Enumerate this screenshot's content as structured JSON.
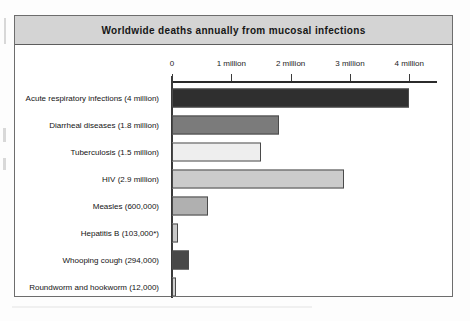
{
  "chart_data": {
    "type": "bar",
    "orientation": "horizontal",
    "title": "Worldwide deaths annually from mucosal infections",
    "xlabel": "",
    "ylabel": "",
    "xlim": [
      0,
      4350000
    ],
    "grid": false,
    "legend": null,
    "tick_labels": [
      "0",
      "1 million",
      "2 million",
      "3 million",
      "4 million"
    ],
    "tick_values": [
      0,
      1000000,
      2000000,
      3000000,
      4000000
    ],
    "categories": [
      "Acute respiratory infections (4 million)",
      "Diarrheal diseases (1.8 million)",
      "Tuberculosis (1.5 million)",
      "HIV (2.9 million)",
      "Measles (600,000)",
      "Hepatitis B (103,000*)",
      "Whooping cough (294,000)",
      "Roundworm and hookworm (12,000)"
    ],
    "values": [
      4000000,
      1800000,
      1500000,
      2900000,
      600000,
      103000,
      294000,
      12000
    ],
    "bar_colors": [
      "#2f2f2f",
      "#7b7b7b",
      "#eeeeee",
      "#cbcbcb",
      "#b0b0b0",
      "#c9c9c9",
      "#484848",
      "#cfcfcf"
    ],
    "bars": [
      {
        "label": "Acute respiratory infections (4 million)",
        "value": 4000000,
        "color": "#2f2f2f"
      },
      {
        "label": "Diarrheal diseases (1.8 million)",
        "value": 1800000,
        "color": "#7b7b7b"
      },
      {
        "label": "Tuberculosis (1.5 million)",
        "value": 1500000,
        "color": "#eeeeee"
      },
      {
        "label": "HIV (2.9 million)",
        "value": 2900000,
        "color": "#cbcbcb"
      },
      {
        "label": "Measles (600,000)",
        "value": 600000,
        "color": "#b0b0b0"
      },
      {
        "label": "Hepatitis B (103,000*)",
        "value": 103000,
        "color": "#c9c9c9"
      },
      {
        "label": "Whooping cough (294,000)",
        "value": 294000,
        "color": "#484848"
      },
      {
        "label": "Roundworm and hookworm (12,000)",
        "value": 12000,
        "color": "#cfcfcf"
      }
    ]
  },
  "figure": {
    "title_band_color": "#d4d4d4",
    "frame_color": "#6d6d6d",
    "axis_color": "#2b2b2b"
  }
}
